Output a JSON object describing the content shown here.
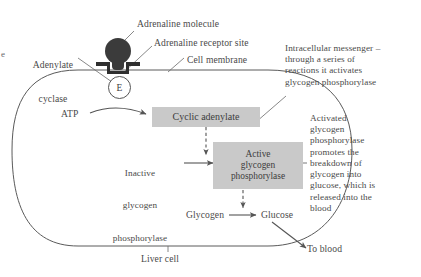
{
  "figure": {
    "cell_label": "Liver cell",
    "colors": {
      "box_fill": "#c9c9c9",
      "molecule": "#3b3b3b",
      "receptor": "#2f2f2f",
      "line": "#5a5a5a",
      "text": "#4a4a4a",
      "background": "#ffffff"
    }
  },
  "callouts": {
    "adrenaline_molecule": "Adrenaline molecule",
    "adrenaline_receptor_site": "Adrenaline receptor site",
    "cell_membrane": "Cell membrane",
    "adenylate_cyclase": "Adenylate\ncyclase",
    "edge_fragment_left": "e",
    "intracellular_messenger": "Intracellular messenger –\nthrough a series of\nreactions it activates\nglycogen phosphorylase",
    "activated_phosphorylase": "Activated\nglycogen\nphosphorylase\npromotes the\nbreakdown of\nglycogen into\nglucose, which is\nreleased into the\nblood"
  },
  "nodes": {
    "atp": "ATP",
    "cyclic_adenylate": "Cyclic adenylate",
    "inactive_phosphorylase": "Inactive\nglycogen\nphosphorylase",
    "active_phosphorylase": "Active\nglycogen\nphosphorylase",
    "glycogen": "Glycogen",
    "glucose": "Glucose",
    "to_blood": "To blood",
    "enzyme_symbol": "E"
  },
  "node_lines": {
    "inactive_1": "Inactive",
    "inactive_2": "glycogen",
    "inactive_3": "phosphorylase",
    "active_1": "Active",
    "active_2": "glycogen",
    "active_3": "phosphorylase",
    "adenylate_1": "Adenylate",
    "adenylate_2": "cyclase"
  },
  "diagram_data": {
    "type": "flow-diagram",
    "steps": [
      {
        "from": "Adrenaline molecule",
        "to": "Adrenaline receptor site",
        "relation": "binds"
      },
      {
        "from": "ATP",
        "to": "Cyclic adenylate",
        "relation": "converted by adenylate cyclase (E)"
      },
      {
        "from": "Cyclic adenylate",
        "to": "Active glycogen phosphorylase",
        "relation": "activates (dashed)"
      },
      {
        "from": "Inactive glycogen phosphorylase",
        "to": "Active glycogen phosphorylase",
        "relation": "becomes"
      },
      {
        "from": "Active glycogen phosphorylase",
        "to": "Glucose",
        "relation": "catalyses (dashed)"
      },
      {
        "from": "Glycogen",
        "to": "Glucose",
        "relation": "broken down to"
      },
      {
        "from": "Glucose",
        "to": "To blood",
        "relation": "released into"
      }
    ]
  }
}
